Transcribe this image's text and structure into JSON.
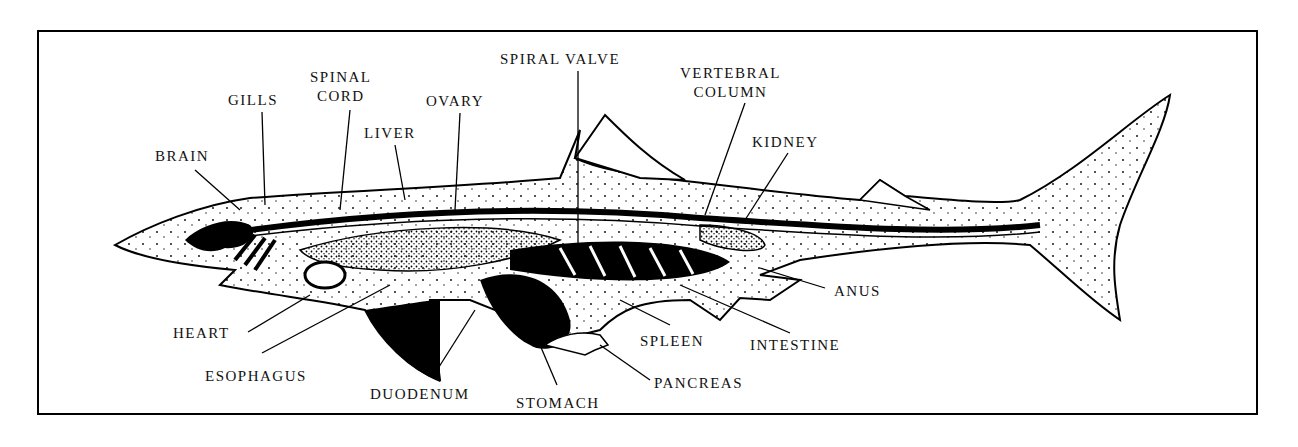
{
  "diagram": {
    "colors": {
      "ink": "#000000",
      "paper": "#ffffff"
    },
    "labels": {
      "brain": "BRAIN",
      "gills": "GILLS",
      "spinal_cord_1": "SPINAL",
      "spinal_cord_2": "CORD",
      "liver": "LIVER",
      "ovary": "OVARY",
      "spiral_valve": "SPIRAL VALVE",
      "vertebral_column_1": "VERTEBRAL",
      "vertebral_column_2": "COLUMN",
      "kidney": "KIDNEY",
      "anus": "ANUS",
      "intestine": "INTESTINE",
      "spleen": "SPLEEN",
      "pancreas": "PANCREAS",
      "stomach": "STOMACH",
      "duodenum": "DUODENUM",
      "esophagus": "ESOPHAGUS",
      "heart": "HEART"
    }
  }
}
